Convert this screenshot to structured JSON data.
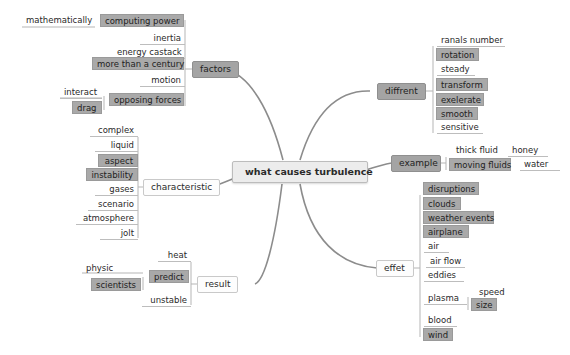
{
  "colors": {
    "node_gray": "#a9a9a9",
    "center_bg": "#ececec",
    "line": "#8c8c8c",
    "background": "#ffffff"
  },
  "center": {
    "label": "what causes turbulence"
  },
  "factors": {
    "label": "factors",
    "children": [
      {
        "label": "computing power",
        "sub": [
          {
            "label": "mathematically"
          }
        ]
      },
      {
        "label": "inertia"
      },
      {
        "label": "energy castack"
      },
      {
        "label": "more than a century"
      },
      {
        "label": "motion"
      },
      {
        "label": "opposing forces",
        "sub": [
          {
            "label": "interact"
          },
          {
            "label": "drag"
          }
        ]
      }
    ]
  },
  "characteristic": {
    "label": "characteristic",
    "children": [
      {
        "label": "complex"
      },
      {
        "label": "liquid"
      },
      {
        "label": "aspect"
      },
      {
        "label": "instability"
      },
      {
        "label": "gases"
      },
      {
        "label": "scenario"
      },
      {
        "label": "atmosphere"
      },
      {
        "label": "jolt"
      }
    ]
  },
  "result": {
    "label": "result",
    "children": [
      {
        "label": "heat"
      },
      {
        "label": "predict",
        "sub": [
          {
            "label": "physic"
          },
          {
            "label": "scientists"
          }
        ]
      },
      {
        "label": "unstable"
      }
    ]
  },
  "diffrent": {
    "label": "diffrent",
    "children": [
      {
        "label": "ranals number"
      },
      {
        "label": "rotation"
      },
      {
        "label": "steady"
      },
      {
        "label": "transform"
      },
      {
        "label": "exelerate"
      },
      {
        "label": "smooth"
      },
      {
        "label": "sensitive"
      }
    ]
  },
  "example": {
    "label": "example",
    "children": [
      {
        "label": "thick fluid",
        "sub": [
          {
            "label": "honey"
          }
        ]
      },
      {
        "label": "moving fluids",
        "sub": [
          {
            "label": "water"
          }
        ]
      }
    ]
  },
  "effet": {
    "label": "effet",
    "children": [
      {
        "label": "disruptions"
      },
      {
        "label": "clouds"
      },
      {
        "label": "weather events"
      },
      {
        "label": "airplane"
      },
      {
        "label": "air"
      },
      {
        "label": "air flow"
      },
      {
        "label": "eddies"
      },
      {
        "label": "plasma",
        "sub": [
          {
            "label": "speed"
          },
          {
            "label": "size"
          }
        ]
      },
      {
        "label": "blood"
      },
      {
        "label": "wind"
      }
    ]
  }
}
